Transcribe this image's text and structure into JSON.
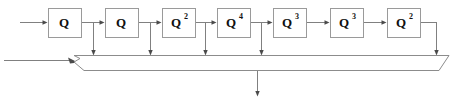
{
  "diagram": {
    "type": "block-diagram",
    "colors": {
      "background": "#ffffff",
      "box_border": "#9a9a9a",
      "wire": "#808080",
      "arrowhead": "#4a4a4a",
      "bus_border": "#8c8c8c",
      "text": "#111111"
    },
    "stages": [
      {
        "index": 1,
        "base": "Q",
        "exponent": "",
        "label": "Q",
        "x": 48,
        "y": 8,
        "w": 33,
        "h": 29
      },
      {
        "index": 2,
        "base": "Q",
        "exponent": "",
        "label": "Q",
        "x": 105,
        "y": 8,
        "w": 33,
        "h": 29
      },
      {
        "index": 3,
        "base": "Q",
        "exponent": "2",
        "label": "Q2",
        "x": 162,
        "y": 8,
        "w": 33,
        "h": 29
      },
      {
        "index": 4,
        "base": "Q",
        "exponent": "4",
        "label": "Q4",
        "x": 217,
        "y": 8,
        "w": 33,
        "h": 29
      },
      {
        "index": 5,
        "base": "Q",
        "exponent": "3",
        "label": "Q3",
        "x": 273,
        "y": 8,
        "w": 33,
        "h": 29
      },
      {
        "index": 6,
        "base": "Q",
        "exponent": "3",
        "label": "Q3",
        "x": 330,
        "y": 8,
        "w": 33,
        "h": 29
      },
      {
        "index": 7,
        "base": "Q",
        "exponent": "2",
        "label": "Q2",
        "x": 387,
        "y": 8,
        "w": 33,
        "h": 29
      }
    ],
    "input": {
      "name": "chain-input",
      "from_x": 20,
      "to_x": 48,
      "y": 22
    },
    "bus_input": {
      "name": "bus-side-input",
      "from_x": 4,
      "to_x": 79,
      "y": 60
    },
    "taps": [
      {
        "name": "tap-1",
        "x": 93,
        "from_y": 22,
        "to_y": 55
      },
      {
        "name": "tap-2",
        "x": 150,
        "from_y": 22,
        "to_y": 55
      },
      {
        "name": "tap-3",
        "x": 205,
        "from_y": 22,
        "to_y": 55
      },
      {
        "name": "tap-4",
        "x": 261,
        "from_y": 22,
        "to_y": 55
      },
      {
        "name": "tap-5",
        "x": 436,
        "from_y": 22,
        "to_y": 55
      }
    ],
    "bus": {
      "name": "summing-bus",
      "top_y": 55,
      "bottom_y": 70,
      "top_left_x": 74,
      "top_right_x": 449,
      "bottom_left_x": 84,
      "bottom_right_x": 439,
      "notch_x": 74,
      "notch_y": 55
    },
    "output": {
      "name": "bus-output",
      "x": 257,
      "from_y": 70,
      "to_y": 96
    }
  }
}
